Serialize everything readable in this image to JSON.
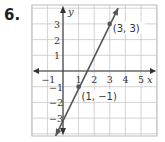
{
  "problem_number": "6.",
  "chart_data": {
    "type": "line",
    "title": "",
    "xlabel": "x",
    "ylabel": "y",
    "xlim": [
      -2,
      6
    ],
    "ylim": [
      -4.2,
      4.2
    ],
    "grid": true,
    "x_ticks": [
      -1,
      1,
      2,
      3,
      4,
      5
    ],
    "x_tick_labels": [
      "−1",
      "1",
      "2",
      "3",
      "4",
      "5"
    ],
    "y_ticks": [
      3,
      2,
      1,
      -1,
      -2,
      -3
    ],
    "y_tick_labels": [
      "3",
      "2",
      "1",
      "−1",
      "−2",
      "−3"
    ],
    "series": [
      {
        "name": "line",
        "equation": "y = 2x - 3",
        "points": [
          {
            "x": 1,
            "y": -1
          },
          {
            "x": 3,
            "y": 3
          }
        ],
        "color": "#555555"
      }
    ],
    "annotations": [
      {
        "text": "(3, 3)",
        "x": 3,
        "y": 3
      },
      {
        "text": "(1, −1)",
        "x": 1,
        "y": -1
      }
    ]
  }
}
